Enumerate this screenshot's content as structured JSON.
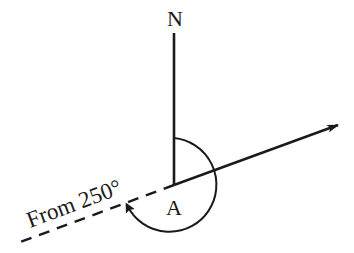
{
  "diagram": {
    "type": "bearing-diagram",
    "north_label": "N",
    "point_label": "A",
    "bearing_label": "From 250°",
    "bearing_degrees": 250,
    "colors": {
      "ink": "#1a1a1a",
      "background": "#ffffff"
    }
  }
}
